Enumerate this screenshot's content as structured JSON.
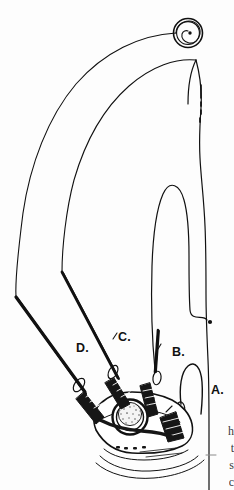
{
  "figure": {
    "kind": "line-art-diagram",
    "background_color": "#fdfdfd",
    "ink_color": "#111111",
    "callout_labels": [
      {
        "id": "A",
        "text": "A.",
        "x": 211,
        "y": 390
      },
      {
        "id": "B",
        "text": "B.",
        "x": 172,
        "y": 352
      },
      {
        "id": "C",
        "text": "C.",
        "x": 118,
        "y": 337
      },
      {
        "id": "D",
        "text": "D.",
        "x": 76,
        "y": 348
      }
    ],
    "edge_text_fragments": [
      {
        "text": "h",
        "y": 430
      },
      {
        "text": "t",
        "y": 447
      },
      {
        "text": "s",
        "y": 464
      },
      {
        "text": "c",
        "y": 481
      }
    ],
    "elements": {
      "spiral_terminal": "spiral-coil-with-center-dot",
      "dashed_terminal": "short-dashed-tail",
      "dot_terminal": "solid-dot-end",
      "dial": "stippled-circular-dial",
      "clips": "four-dark-hatched-finger-clips",
      "cuff": "wavy-wrist-cuff-lines"
    }
  }
}
